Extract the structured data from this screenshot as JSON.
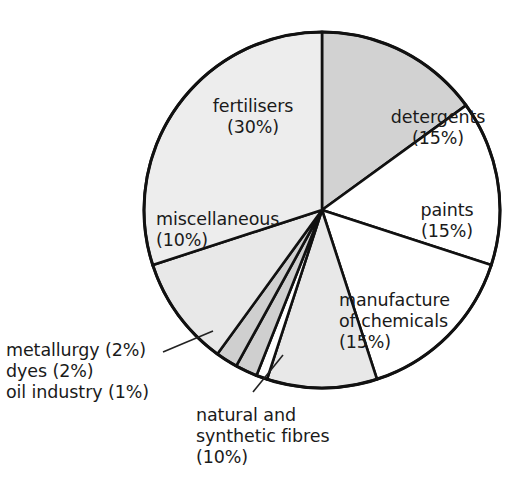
{
  "chart_data": {
    "type": "pie",
    "title": "",
    "subtitle": "",
    "xlabel": "",
    "ylabel": "",
    "legend_position": "none",
    "grid": false,
    "units": "percent",
    "start_angle_deg": 0,
    "direction": "clockwise",
    "categories": [
      "detergents",
      "paints",
      "manufacture of chemicals",
      "natural and synthetic fibres",
      "oil industry",
      "dyes",
      "metallurgy",
      "miscellaneous",
      "fertilisers"
    ],
    "values": [
      15,
      15,
      15,
      10,
      1,
      2,
      2,
      10,
      30
    ],
    "slices": [
      {
        "label": "detergents",
        "value": 15,
        "value_text": "(15%)",
        "fill": "#d2d2d2",
        "label_lines": [
          "detergents",
          "(15%)"
        ]
      },
      {
        "label": "paints",
        "value": 15,
        "value_text": "(15%)",
        "fill": "#ffffff",
        "label_lines": [
          "paints",
          "(15%)"
        ]
      },
      {
        "label": "manufacture of chemicals",
        "value": 15,
        "value_text": "(15%)",
        "fill": "#ffffff",
        "label_lines": [
          "manufacture",
          "of chemicals",
          "(15%)"
        ]
      },
      {
        "label": "natural and synthetic fibres",
        "value": 10,
        "value_text": "(10%)",
        "fill": "#e8e8e8",
        "label_lines": [
          "natural and",
          "synthetic fibres",
          "(10%)"
        ]
      },
      {
        "label": "oil industry",
        "value": 1,
        "value_text": "(1%)",
        "fill": "#ffffff",
        "label_lines": [
          "oil industry (1%)"
        ]
      },
      {
        "label": "dyes",
        "value": 2,
        "value_text": "(2%)",
        "fill": "#cfcfcf",
        "label_lines": [
          "dyes (2%)"
        ]
      },
      {
        "label": "metallurgy",
        "value": 2,
        "value_text": "(2%)",
        "fill": "#cfcfcf",
        "label_lines": [
          "metallurgy (2%)"
        ]
      },
      {
        "label": "miscellaneous",
        "value": 10,
        "value_text": "(10%)",
        "fill": "#e8e8e8",
        "label_lines": [
          "miscellaneous",
          "(10%)"
        ]
      },
      {
        "label": "fertilisers",
        "value": 30,
        "value_text": "(30%)",
        "fill": "#ededed",
        "label_lines": [
          "fertilisers",
          "(30%)"
        ]
      }
    ]
  },
  "labels": {
    "fertilisers": "fertilisers\n(30%)",
    "detergents": "detergents\n(15%)",
    "paints": "paints\n(15%)",
    "manufacture": "manufacture\nof chemicals\n(15%)",
    "miscellaneous": "miscellaneous\n(10%)",
    "smalls": "metallurgy (2%)\ndyes (2%)\noil industry (1%)",
    "fibres": "natural and\nsynthetic fibres\n(10%)"
  },
  "colors": {
    "outline": "#111111",
    "text": "#1a1a1a",
    "background": "#ffffff",
    "grey_dark": "#cfcfcf",
    "grey_mid": "#e8e8e8",
    "grey_light": "#ededed",
    "white_slice": "#ffffff"
  }
}
